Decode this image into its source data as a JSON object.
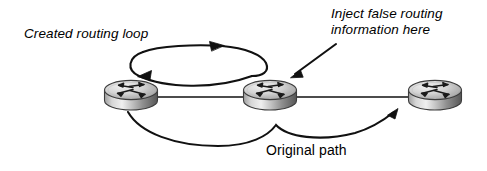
{
  "diagram": {
    "background_color": "#ffffff",
    "line_color": "#000000",
    "router_body_color": "#b4b4b4",
    "router_top_color": "#d8d8d8",
    "router_shadow_color": "#6e6e6e",
    "labels": {
      "created_loop": "Created routing loop",
      "inject_line1": "Inject false routing",
      "inject_line2": "information here",
      "original_path": "Original path"
    },
    "nodes": [
      {
        "id": "router-left",
        "name": "router-left",
        "icon": "router-icon",
        "cx": 130,
        "cy": 96
      },
      {
        "id": "router-middle",
        "name": "router-middle",
        "icon": "router-icon",
        "cx": 269,
        "cy": 96
      },
      {
        "id": "router-right",
        "name": "router-right",
        "icon": "router-icon",
        "cx": 435,
        "cy": 96
      }
    ],
    "links": [
      {
        "id": "link-left-middle",
        "from": "router-left",
        "to": "router-middle",
        "style": "straight"
      },
      {
        "id": "link-middle-right",
        "from": "router-middle",
        "to": "router-right",
        "style": "straight"
      }
    ],
    "annotations": [
      {
        "id": "routing-loop-arrows",
        "name": "routing-loop-arrow",
        "label": "Created routing loop",
        "description": "Elliptical two-headed loop above the left and middle routers",
        "arrowheads": 2
      },
      {
        "id": "inject-pointer-arrow",
        "name": "inject-pointer-arrow",
        "label": "Inject false routing information here",
        "description": "Diagonal arrow pointing down-left to the middle router",
        "arrowheads": 1
      },
      {
        "id": "original-path-arrow",
        "name": "original-path-arrow",
        "label": "Original path",
        "description": "Curved arrow from left router sweeping below to the right router",
        "arrowheads": 1
      }
    ]
  }
}
